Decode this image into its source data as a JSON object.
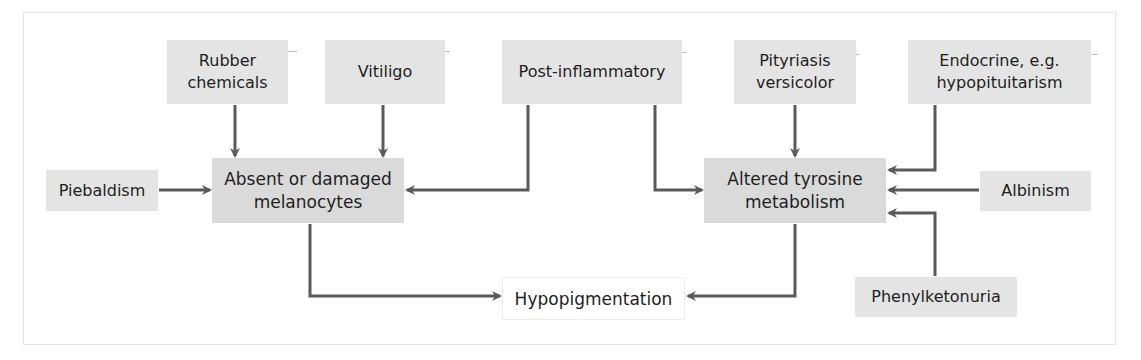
{
  "diagram": {
    "colors": {
      "box_fill": "#e4e4e4",
      "hub_fill": "#dadada",
      "outcome_fill": "#ffffff",
      "arrow": "#5a5a5a",
      "text": "#1e1e1e"
    },
    "nodes": {
      "rubber_chemicals": "Rubber\nchemicals",
      "vitiligo": "Vitiligo",
      "post_inflammatory": "Post-inflammatory",
      "pityriasis_versicolor": "Pityriasis\nversicolor",
      "endocrine": "Endocrine, e.g.\nhypopituitarism",
      "piebaldism": "Piebaldism",
      "absent_melanocytes": "Absent or damaged\nmelanocytes",
      "altered_tyrosine": "Altered tyrosine\nmetabolism",
      "albinism": "Albinism",
      "phenylketonuria": "Phenylketonuria",
      "hypopigmentation": "Hypopigmentation"
    },
    "edges": [
      {
        "from": "Rubber chemicals",
        "to": "Absent or damaged melanocytes"
      },
      {
        "from": "Vitiligo",
        "to": "Absent or damaged melanocytes"
      },
      {
        "from": "Piebaldism",
        "to": "Absent or damaged melanocytes"
      },
      {
        "from": "Post-inflammatory",
        "to": "Absent or damaged melanocytes"
      },
      {
        "from": "Post-inflammatory",
        "to": "Altered tyrosine metabolism"
      },
      {
        "from": "Pityriasis versicolor",
        "to": "Altered tyrosine metabolism"
      },
      {
        "from": "Endocrine, e.g. hypopituitarism",
        "to": "Altered tyrosine metabolism"
      },
      {
        "from": "Albinism",
        "to": "Altered tyrosine metabolism"
      },
      {
        "from": "Phenylketonuria",
        "to": "Altered tyrosine metabolism"
      },
      {
        "from": "Absent or damaged melanocytes",
        "to": "Hypopigmentation"
      },
      {
        "from": "Altered tyrosine metabolism",
        "to": "Hypopigmentation"
      }
    ]
  }
}
